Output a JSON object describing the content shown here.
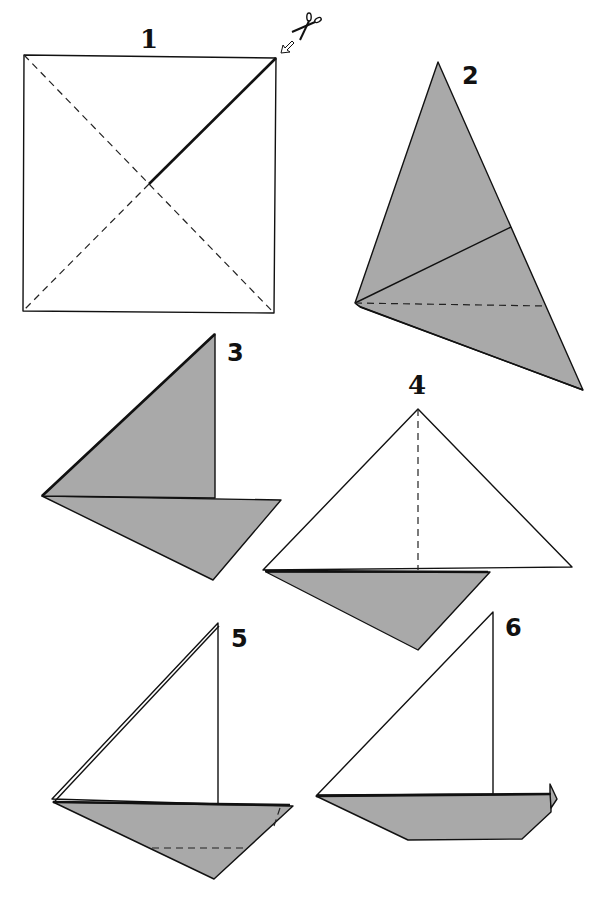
{
  "diagram": {
    "colors": {
      "paper_front": "#ffffff",
      "paper_back": "#a9a9a9",
      "lines": "#111111"
    },
    "steps": [
      {
        "number": "1",
        "description": "Square with dashed diagonals; solid cut line from center to top-right corner",
        "icons": [
          "scissors-icon",
          "arrow-icon"
        ]
      },
      {
        "number": "2",
        "description": "Grey folded kite shape with solid crease and dashed fold line"
      },
      {
        "number": "3",
        "description": "Grey sail shape folded above a grey hull triangle"
      },
      {
        "number": "4",
        "description": "White triangle with dashed vertical center fold above grey hull"
      },
      {
        "number": "5",
        "description": "White sail with grey hull showing dashed fold lines"
      },
      {
        "number": "6",
        "description": "Finished sailboat with white sail and grey trapezoid hull"
      }
    ]
  }
}
